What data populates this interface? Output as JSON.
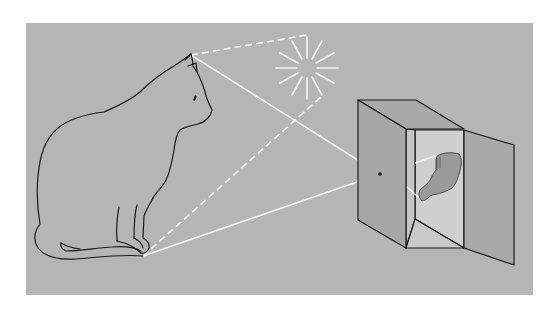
{
  "diagram": {
    "colors": {
      "page": "#ffffff",
      "panel": "#b5b5b5",
      "ray": "#f4f4f4",
      "outline": "#1a1a1a",
      "box_front": "#a7a7a7",
      "box_top": "#a9a9a9",
      "box_side_inner": "#c6c6c6",
      "box_back_wall": "#cfcfcf",
      "box_floor": "#c9c9c9",
      "door": "#a9a9a9",
      "image_fill": "#9a9a9a"
    },
    "elements": {
      "cat": "cat-silhouette",
      "sun": "sun-light-source",
      "box": "pinhole-camera-box",
      "pinhole": "pinhole-aperture",
      "projected_image": "inverted-cat-image"
    },
    "rays": [
      {
        "name": "ray-ear-to-pinhole",
        "style": "solid",
        "from": [
          191,
          54
        ],
        "to": [
          380,
          174
        ]
      },
      {
        "name": "ray-foot-to-pinhole",
        "style": "solid",
        "from": [
          143,
          256
        ],
        "to": [
          380,
          174
        ]
      },
      {
        "name": "ray-ear-to-sun",
        "style": "dashed",
        "from": [
          191,
          54
        ],
        "to": [
          307,
          35
        ]
      },
      {
        "name": "ray-foot-to-sun",
        "style": "dashed",
        "from": [
          143,
          256
        ],
        "to": [
          321,
          97
        ]
      }
    ]
  }
}
